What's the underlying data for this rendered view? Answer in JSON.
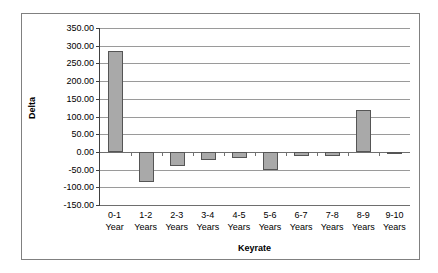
{
  "chart_data": {
    "type": "bar",
    "title": "",
    "xlabel": "Keyrate",
    "ylabel": "Delta",
    "categories": [
      "0-1 Year",
      "1-2 Years",
      "2-3 Years",
      "3-4 Years",
      "4-5 Years",
      "5-6 Years",
      "6-7 Years",
      "7-8 Years",
      "8-9 Years",
      "9-10 Years"
    ],
    "category_lines": [
      [
        "0-1",
        "Year"
      ],
      [
        "1-2",
        "Years"
      ],
      [
        "2-3",
        "Years"
      ],
      [
        "3-4",
        "Years"
      ],
      [
        "4-5",
        "Years"
      ],
      [
        "5-6",
        "Years"
      ],
      [
        "6-7",
        "Years"
      ],
      [
        "7-8",
        "Years"
      ],
      [
        "8-9",
        "Years"
      ],
      [
        "9-10",
        "Years"
      ]
    ],
    "values": [
      285.0,
      -85.0,
      -40.0,
      -22.0,
      -18.0,
      -52.0,
      -12.0,
      -11.0,
      118.0,
      -6.0
    ],
    "ylim": [
      -150,
      350
    ],
    "ytick_step": 50,
    "ytick_labels": [
      "350.00",
      "300.00",
      "250.00",
      "200.00",
      "150.00",
      "100.00",
      "50.00",
      "0.00",
      "-50.00",
      "-100.00",
      "-150.00"
    ],
    "grid": true,
    "legend": "none",
    "bar_color": "#a9a9a9",
    "bar_border_color": "#555555",
    "gridline_color": "#9a9a9a",
    "axis_color": "#404040",
    "frame_color": "#808080",
    "text_color": "#000000"
  }
}
